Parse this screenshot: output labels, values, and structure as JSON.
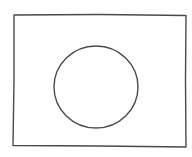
{
  "sketch": {
    "description": "Hand-drawn rectangle with a circle in the center",
    "stroke_color": "#4a4a4a",
    "background": "#ffffff",
    "rectangle": {
      "x1": 14,
      "y1": 15,
      "x2": 186,
      "y2": 147
    },
    "circle": {
      "cx": 96,
      "cy": 87,
      "rx": 42,
      "ry": 41
    }
  }
}
